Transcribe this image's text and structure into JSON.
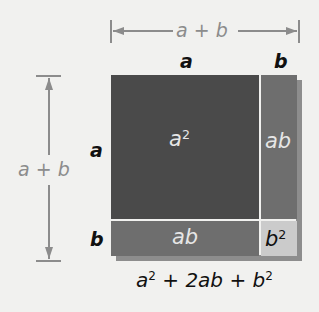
{
  "diagram": {
    "top_dimension": {
      "label_a": "a",
      "label_plus": "+",
      "label_b": "b"
    },
    "left_dimension": {
      "label_a": "a",
      "label_plus": "+",
      "label_b": "b"
    },
    "top_labels": {
      "a": "a",
      "b": "b"
    },
    "side_labels": {
      "a": "a",
      "b": "b"
    },
    "cells": {
      "a_squared": {
        "base": "a",
        "exp": "2",
        "color": "#4a4a4a"
      },
      "ab_right": {
        "label": "ab",
        "color": "#6e6e6e"
      },
      "ab_bottom": {
        "label": "ab",
        "color": "#6e6e6e"
      },
      "b_squared": {
        "base": "b",
        "exp": "2",
        "color": "#cbcbcb"
      }
    },
    "formula": {
      "t1_base": "a",
      "t1_exp": "2",
      "plus1": "+",
      "t2": "2ab",
      "plus2": "+",
      "t3_base": "b",
      "t3_exp": "2"
    },
    "colors": {
      "background": "#f1f1ef",
      "dimension_lines": "#8c8c8c",
      "divider": "#d9d9d9"
    }
  }
}
